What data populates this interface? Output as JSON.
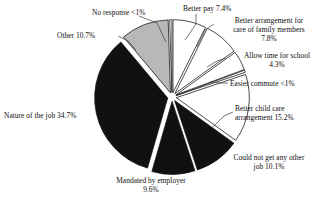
{
  "chart_data": {
    "type": "pie",
    "title": "",
    "subtitle": "",
    "xlabel": "",
    "ylabel": "",
    "legend_position": "none",
    "grid": false,
    "units": "percent",
    "categories": [
      "Better pay",
      "Better arrangement for care of family members",
      "Allow time for school",
      "Easier commute",
      "Better child care arrangement",
      "Could not get any other job",
      "Mandated by employer",
      "Nature of the job",
      "Other",
      "No response"
    ],
    "values": [
      7.4,
      7.8,
      4.3,
      0.5,
      15.2,
      10.1,
      9.6,
      34.7,
      10.7,
      0.5
    ],
    "value_labels": [
      "7.4%",
      "7.8%",
      "4.3%",
      "<1%",
      "15.2%",
      "10.1%",
      "9.6%",
      "34.7%",
      "10.7%",
      "<1%"
    ],
    "slice_fills": [
      "#ffffff",
      "#ffffff",
      "#ffffff",
      "#ffffff",
      "#ffffff",
      "#111111",
      "#111111",
      "#111111",
      "#b8b8b8",
      "#ffffff"
    ],
    "slices": [
      {
        "name": "better-pay",
        "label": "Better pay 7.4%",
        "lines": [
          "Better pay 7.4%"
        ],
        "value": 7.4,
        "value_label": "7.4%",
        "fill": "#ffffff"
      },
      {
        "name": "care-of-family-members",
        "label": "Better arrangement for care of family members 7.8%",
        "lines": [
          "Better arrangement for",
          "care of family members",
          "7.8%"
        ],
        "value": 7.8,
        "value_label": "7.8%",
        "fill": "#ffffff"
      },
      {
        "name": "allow-time-for-school",
        "label": "Allow time for school 4.3%",
        "lines": [
          "Allow time for school",
          "4.3%"
        ],
        "value": 4.3,
        "value_label": "4.3%",
        "fill": "#ffffff"
      },
      {
        "name": "easier-commute",
        "label": "Easier commute <1%",
        "lines": [
          "Easier commute <1%"
        ],
        "value": 0.5,
        "value_label": "<1%",
        "fill": "#ffffff"
      },
      {
        "name": "better-child-care-arrangement",
        "label": "Better child care arrangement 15.2%",
        "lines": [
          "Better child care",
          "arrangement 15.2%"
        ],
        "value": 15.2,
        "value_label": "15.2%",
        "fill": "#ffffff"
      },
      {
        "name": "could-not-get-any-other-job",
        "label": "Could not get any other job 10.1%",
        "lines": [
          "Could not get any other",
          "job 10.1%"
        ],
        "value": 10.1,
        "value_label": "10.1%",
        "fill": "#111111"
      },
      {
        "name": "mandated-by-employer",
        "label": "Mandated by employer 9.6%",
        "lines": [
          "Mandated by employer",
          "9.6%"
        ],
        "value": 9.6,
        "value_label": "9.6%",
        "fill": "#111111"
      },
      {
        "name": "nature-of-the-job",
        "label": "Nature of the job 34.7%",
        "lines": [
          "Nature of the job 34.7%"
        ],
        "value": 34.7,
        "value_label": "34.7%",
        "fill": "#111111"
      },
      {
        "name": "other",
        "label": "Other 10.7%",
        "lines": [
          "Other 10.7%"
        ],
        "value": 10.7,
        "value_label": "10.7%",
        "fill": "#b8b8b8"
      },
      {
        "name": "no-response",
        "label": "No response <1%",
        "lines": [
          "No response <1%"
        ],
        "value": 0.5,
        "value_label": "<1%",
        "fill": "#ffffff"
      }
    ]
  },
  "labels": {
    "no_response": "No response <1%",
    "better_pay": "Better pay 7.4%",
    "care_family_1": "Better arrangement for",
    "care_family_2": "care of family members",
    "care_family_3": "7.8%",
    "allow_school_1": "Allow time for school",
    "allow_school_2": "4.3%",
    "easier_commute": "Easier commute <1%",
    "other": "Other 10.7%",
    "child_care_1": "Better child care",
    "child_care_2": "arrangement 15.2%",
    "could_not_1": "Could not get any other",
    "could_not_2": "job 10.1%",
    "nature_job": "Nature of the job 34.7%",
    "mandated_1": "Mandated by employer",
    "mandated_2": "9.6%"
  },
  "colors": {
    "black_slice": "#111111",
    "gray_slice": "#b8b8b8",
    "white_slice": "#ffffff",
    "outline": "#111111",
    "leader_line": "#444444",
    "background": "#ffffff"
  }
}
